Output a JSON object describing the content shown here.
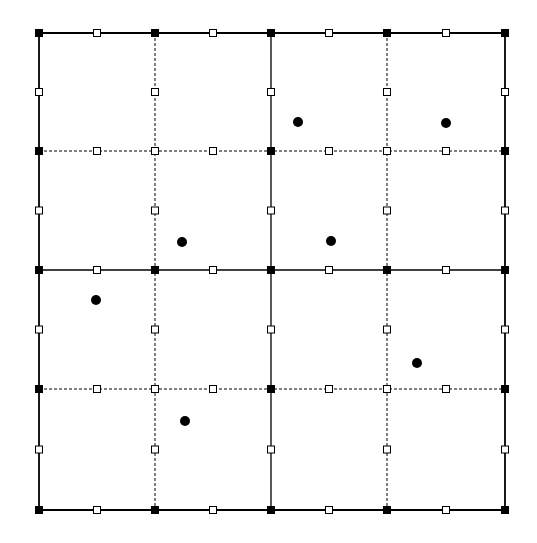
{
  "diagram": {
    "title": "",
    "grid": {
      "x_lines": [
        39,
        155,
        271,
        387,
        505
      ],
      "y_lines": [
        33,
        151,
        270,
        389,
        510
      ],
      "solid_indices": [
        0,
        2,
        4
      ],
      "dashed_indices": [
        1,
        3
      ],
      "line_color": "#000000"
    },
    "nodes": {
      "corner_filled_color": "#000000",
      "open_fill": "#ffffff",
      "size": 7
    },
    "points": [
      {
        "x": 298,
        "y": 122
      },
      {
        "x": 446,
        "y": 123
      },
      {
        "x": 182,
        "y": 242
      },
      {
        "x": 331,
        "y": 241
      },
      {
        "x": 96,
        "y": 300
      },
      {
        "x": 417,
        "y": 363
      },
      {
        "x": 185,
        "y": 421
      }
    ],
    "point_radius": 5
  }
}
